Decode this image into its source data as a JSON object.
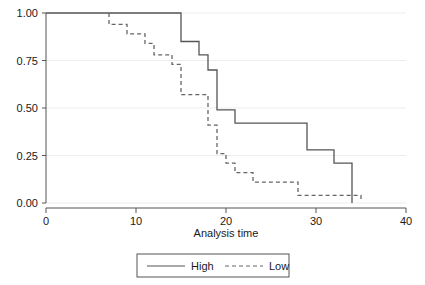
{
  "chart_data": {
    "type": "line",
    "subtype": "kaplan-meier-step",
    "title": "",
    "xlabel": "Analysis time",
    "ylabel": "",
    "xlim": [
      0,
      40
    ],
    "ylim": [
      0,
      1
    ],
    "xticks": [
      0,
      10,
      20,
      30,
      40
    ],
    "xtick_labels": [
      "0",
      "10",
      "20",
      "30",
      "40"
    ],
    "yticks": [
      0.0,
      0.25,
      0.5,
      0.75,
      1.0
    ],
    "ytick_labels": [
      "0.00",
      "0.25",
      "0.50",
      "0.75",
      "1.00"
    ],
    "grid": "horizontal",
    "legend_position": "bottom-center",
    "series": [
      {
        "name": "High",
        "style": "solid",
        "color": "#555555",
        "points": [
          [
            0,
            1.0
          ],
          [
            15,
            1.0
          ],
          [
            15,
            0.85
          ],
          [
            17,
            0.85
          ],
          [
            17,
            0.78
          ],
          [
            18,
            0.78
          ],
          [
            18,
            0.7
          ],
          [
            19,
            0.7
          ],
          [
            19,
            0.49
          ],
          [
            21,
            0.49
          ],
          [
            21,
            0.42
          ],
          [
            29,
            0.42
          ],
          [
            29,
            0.28
          ],
          [
            32,
            0.28
          ],
          [
            32,
            0.21
          ],
          [
            34,
            0.21
          ],
          [
            34,
            0.0
          ]
        ]
      },
      {
        "name": "Low",
        "style": "dashed",
        "color": "#666666",
        "points": [
          [
            7,
            1.0
          ],
          [
            7,
            0.94
          ],
          [
            9,
            0.94
          ],
          [
            9,
            0.89
          ],
          [
            11,
            0.89
          ],
          [
            11,
            0.84
          ],
          [
            12,
            0.84
          ],
          [
            12,
            0.78
          ],
          [
            14,
            0.78
          ],
          [
            14,
            0.73
          ],
          [
            15,
            0.73
          ],
          [
            15,
            0.57
          ],
          [
            18,
            0.57
          ],
          [
            18,
            0.41
          ],
          [
            19,
            0.41
          ],
          [
            19,
            0.26
          ],
          [
            20,
            0.26
          ],
          [
            20,
            0.21
          ],
          [
            21,
            0.21
          ],
          [
            21,
            0.16
          ],
          [
            23,
            0.16
          ],
          [
            23,
            0.11
          ],
          [
            28,
            0.11
          ],
          [
            28,
            0.04
          ],
          [
            35,
            0.04
          ],
          [
            35,
            0.02
          ]
        ]
      }
    ]
  },
  "legend": {
    "items": [
      {
        "label": "High",
        "style": "solid"
      },
      {
        "label": "Low",
        "style": "dashed"
      }
    ]
  },
  "colors": {
    "grid": "#ededed",
    "axis": "#555555",
    "text": "#1a1a1a",
    "high_series": "#555555",
    "low_series": "#666666",
    "background": "#ffffff"
  }
}
